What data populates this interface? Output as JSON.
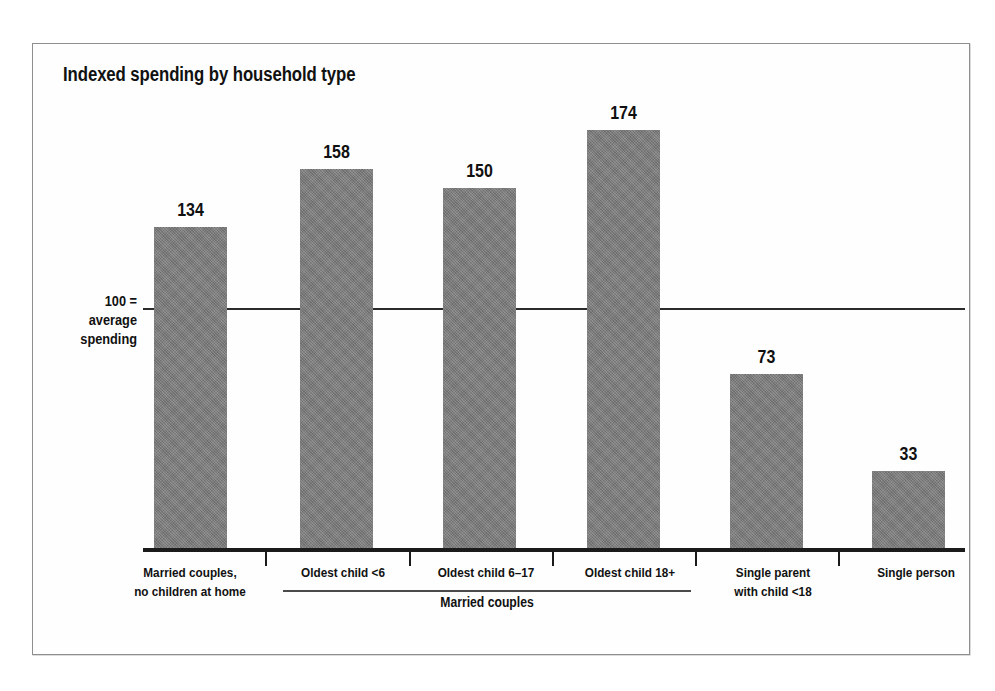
{
  "chart_data": {
    "type": "bar",
    "title": "Indexed spending by household type",
    "xlabel": "",
    "ylabel": "100 = average spending",
    "categories": [
      "Married couples,\nno children at home",
      "Oldest child <6",
      "Oldest child 6–17",
      "Oldest child 18+",
      "Single parent\nwith child <18",
      "Single person"
    ],
    "values": [
      134,
      158,
      150,
      174,
      73,
      33
    ],
    "reference_line": 100,
    "reference_line_label": "100 =\naverage\nspending",
    "ylim": [
      0,
      188
    ],
    "grid": false,
    "legend": false,
    "group_bracket": {
      "label": "Married couples",
      "spans_categories": [
        "Oldest child <6",
        "Oldest child 6–17",
        "Oldest child 18+"
      ]
    },
    "bar_color": "#7d7d7d",
    "axis_color": "#1a1a1a",
    "text_color": "#111111"
  },
  "chart": {
    "title": "Indexed spending by household type",
    "reference_label_line1": "100 =",
    "reference_label_line2": "average",
    "reference_label_line3": "spending",
    "group_label": "Married couples",
    "bars": [
      {
        "value_label": "134",
        "category_line1": "Married couples,",
        "category_line2": "no children at home"
      },
      {
        "value_label": "158",
        "category_line1": "Oldest child <6",
        "category_line2": ""
      },
      {
        "value_label": "150",
        "category_line1": "Oldest child 6–17",
        "category_line2": ""
      },
      {
        "value_label": "174",
        "category_line1": "Oldest child 18+",
        "category_line2": ""
      },
      {
        "value_label": "73",
        "category_line1": "Single parent",
        "category_line2": "with child <18"
      },
      {
        "value_label": "33",
        "category_line1": "Single person",
        "category_line2": ""
      }
    ]
  }
}
